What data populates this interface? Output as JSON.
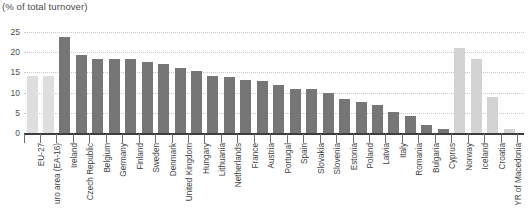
{
  "chart_data": {
    "type": "bar",
    "title": "(% of total turnover)",
    "xlabel": "",
    "ylabel": "",
    "ylim": [
      0,
      25
    ],
    "yticks": [
      0,
      5,
      10,
      15,
      20,
      25
    ],
    "ytick_labels": [
      "0",
      "5",
      "10",
      "15",
      "20",
      "25"
    ],
    "grid": true,
    "legend": "none",
    "colors": {
      "aggregate": "#dedede",
      "member_state": "#767676",
      "non_eu": "#d3d3d3",
      "axis": "#3d3d3d",
      "gridline": "#c9c9c9",
      "text": "#3f3f3f"
    },
    "categories": [
      "EU-27",
      "uro area (EA-16)",
      "Ireland",
      "Czech Republic",
      "Belgium",
      "Germany",
      "Finland",
      "Sweden",
      "Denmark",
      "United Kingdom",
      "Hungary",
      "Lithuania",
      "Netherlands",
      "France",
      "Austria",
      "Portugal",
      "Spain",
      "Slovakia",
      "Slovenia",
      "Estonia",
      "Poland",
      "Latvia",
      "Italy",
      "Romania",
      "Bulgaria",
      "Cyprus",
      "Norway",
      "Iceland",
      "Croatia",
      "YR of Macedonia"
    ],
    "values": [
      14.0,
      14.0,
      23.8,
      19.3,
      18.3,
      18.3,
      18.3,
      17.5,
      17.2,
      16.2,
      15.3,
      14.0,
      13.8,
      13.0,
      12.8,
      11.8,
      11.0,
      11.0,
      9.8,
      8.3,
      7.7,
      7.0,
      5.3,
      4.3,
      2.0,
      1.0,
      21.0,
      18.2,
      9.0,
      1.0
    ],
    "group": [
      "aggregate",
      "aggregate",
      "member_state",
      "member_state",
      "member_state",
      "member_state",
      "member_state",
      "member_state",
      "member_state",
      "member_state",
      "member_state",
      "member_state",
      "member_state",
      "member_state",
      "member_state",
      "member_state",
      "member_state",
      "member_state",
      "member_state",
      "member_state",
      "member_state",
      "member_state",
      "member_state",
      "member_state",
      "member_state",
      "member_state",
      "non_eu",
      "non_eu",
      "non_eu",
      "non_eu"
    ]
  }
}
